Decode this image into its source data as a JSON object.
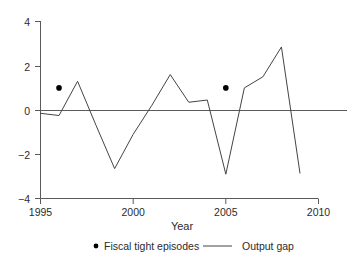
{
  "chart_data": {
    "type": "line",
    "title": "",
    "xlabel": "Year",
    "ylabel": "",
    "xlim": [
      1995,
      2010
    ],
    "ylim": [
      -4,
      4
    ],
    "grid": false,
    "zero_line": true,
    "legend_position": "bottom",
    "xticks": [
      1995,
      2000,
      2005,
      2010
    ],
    "xtick_labels": [
      "1995",
      "2000",
      "2005",
      "2010"
    ],
    "yticks": [
      -4,
      -2,
      0,
      2,
      4
    ],
    "ytick_labels": [
      "−4",
      "−2",
      "0",
      "2",
      "4"
    ],
    "series": [
      {
        "name": "Output gap",
        "type": "line",
        "color": "#444444",
        "x": [
          1995,
          1996,
          1997,
          1998,
          1999,
          2000,
          2001,
          2002,
          2003,
          2004,
          2005,
          2006,
          2007,
          2008,
          2009
        ],
        "values": [
          -0.15,
          -0.25,
          1.3,
          -0.7,
          -2.65,
          -1.1,
          0.2,
          1.6,
          0.35,
          0.45,
          -2.9,
          1.0,
          1.5,
          2.85,
          -2.85
        ]
      },
      {
        "name": "Fiscal tight episodes",
        "type": "scatter",
        "color": "#000000",
        "x": [
          1996,
          2005
        ],
        "values": [
          1,
          1
        ]
      }
    ]
  },
  "legend": {
    "items": [
      {
        "label": "Fiscal tight episodes",
        "marker": "dot",
        "color": "#000000"
      },
      {
        "label": "Output gap",
        "marker": "line",
        "color": "#444444"
      }
    ]
  },
  "axes": {
    "x_title": "Year"
  },
  "colors": {
    "axis": "#5a5a5a",
    "line": "#444444",
    "marker": "#000000",
    "text": "#2b2b2b",
    "background": "#ffffff"
  }
}
